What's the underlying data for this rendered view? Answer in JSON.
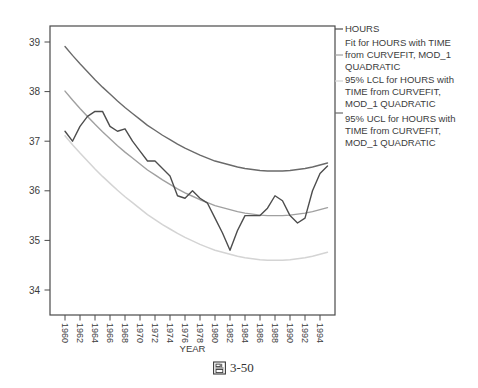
{
  "figure": {
    "caption_full": "圖 3-50",
    "caption_cjk": "圖",
    "caption_number": "3-50"
  },
  "chart_data": {
    "type": "line",
    "title": "",
    "xlabel": "YEAR",
    "ylabel": "",
    "grid": false,
    "legend_position": "right",
    "y_ticks": [
      34,
      35,
      36,
      37,
      38,
      39
    ],
    "ylim": [
      33.5,
      39.35
    ],
    "xlim_years": [
      1958,
      1996
    ],
    "x_tick_labels": [
      "1960",
      "1962",
      "1964",
      "1966",
      "1968",
      "1970",
      "1972",
      "1974",
      "1976",
      "1978",
      "1980",
      "1982",
      "1984",
      "1986",
      "1988",
      "1990",
      "1992",
      "1994"
    ],
    "years": [
      1960,
      1961,
      1962,
      1963,
      1964,
      1965,
      1966,
      1967,
      1968,
      1969,
      1970,
      1971,
      1972,
      1973,
      1974,
      1975,
      1976,
      1977,
      1978,
      1979,
      1980,
      1981,
      1982,
      1983,
      1984,
      1985,
      1986,
      1987,
      1988,
      1989,
      1990,
      1991,
      1992,
      1993,
      1994,
      1995
    ],
    "axis_color": "#4a4a4a",
    "text_color": "#3c3c3c",
    "series": [
      {
        "id": "hours",
        "name": "HOURS",
        "color": "#4d4d4d",
        "width": 1.4,
        "values": [
          37.2,
          37.0,
          37.3,
          37.5,
          37.6,
          37.6,
          37.3,
          37.2,
          37.25,
          37.0,
          36.8,
          36.6,
          36.6,
          36.45,
          36.3,
          35.9,
          35.85,
          36.0,
          35.85,
          35.75,
          35.45,
          35.15,
          34.8,
          35.2,
          35.5,
          35.5,
          35.5,
          35.65,
          35.9,
          35.8,
          35.5,
          35.35,
          35.45,
          36.0,
          36.35,
          36.5
        ]
      },
      {
        "id": "fit",
        "name": "Fit for HOURS with TIME from CURVEFIT, MOD_1 QUADRATIC",
        "color": "#a0a0a0",
        "width": 1.4,
        "values": [
          38.01,
          37.83,
          37.66,
          37.5,
          37.34,
          37.19,
          37.05,
          36.91,
          36.78,
          36.66,
          36.54,
          36.42,
          36.32,
          36.22,
          36.13,
          36.04,
          35.96,
          35.89,
          35.82,
          35.76,
          35.7,
          35.66,
          35.62,
          35.58,
          35.55,
          35.53,
          35.51,
          35.5,
          35.5,
          35.5,
          35.51,
          35.53,
          35.55,
          35.58,
          35.62,
          35.66
        ]
      },
      {
        "id": "lcl",
        "name": "95% LCL for HOURS with TIME from CURVEFIT, MOD_1 QUADRATIC",
        "color": "#d4d4d4",
        "width": 1.5,
        "values": [
          37.11,
          36.93,
          36.76,
          36.6,
          36.44,
          36.29,
          36.15,
          36.01,
          35.88,
          35.76,
          35.64,
          35.52,
          35.42,
          35.32,
          35.23,
          35.14,
          35.06,
          34.99,
          34.92,
          34.86,
          34.8,
          34.76,
          34.72,
          34.68,
          34.65,
          34.63,
          34.61,
          34.6,
          34.6,
          34.6,
          34.61,
          34.63,
          34.65,
          34.68,
          34.72,
          34.76
        ]
      },
      {
        "id": "ucl",
        "name": "95% UCL for HOURS with TIME from CURVEFIT, MOD_1 QUADRATIC",
        "color": "#6a6a6a",
        "width": 1.4,
        "values": [
          38.91,
          38.73,
          38.56,
          38.4,
          38.24,
          38.09,
          37.95,
          37.81,
          37.68,
          37.56,
          37.44,
          37.32,
          37.22,
          37.12,
          37.03,
          36.94,
          36.86,
          36.79,
          36.72,
          36.66,
          36.6,
          36.56,
          36.52,
          36.48,
          36.45,
          36.43,
          36.41,
          36.4,
          36.4,
          36.4,
          36.41,
          36.43,
          36.45,
          36.48,
          36.52,
          36.56
        ]
      }
    ]
  },
  "legend": {
    "entries": [
      {
        "id": "hours",
        "color": "#4d4d4d",
        "lines": [
          "HOURS"
        ]
      },
      {
        "id": "fit",
        "color": "#a0a0a0",
        "lines": [
          "Fit for HOURS with TIME",
          "from CURVEFIT, MOD_1",
          "QUADRATIC"
        ]
      },
      {
        "id": "lcl",
        "color": "#d4d4d4",
        "lines": [
          "95% LCL for HOURS with",
          "TIME from CURVEFIT,",
          "MOD_1 QUADRATIC"
        ]
      },
      {
        "id": "ucl",
        "color": "#6a6a6a",
        "lines": [
          "95% UCL for HOURS with",
          "TIME from CURVEFIT,",
          "MOD_1 QUADRATIC"
        ]
      }
    ]
  }
}
